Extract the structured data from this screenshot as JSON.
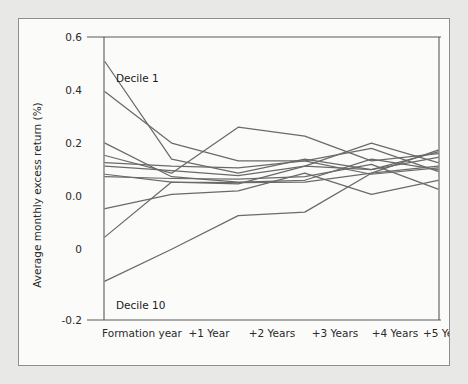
{
  "chart_data": {
    "type": "line",
    "title": "",
    "xlabel": "",
    "ylabel": "Average monthly excess return (%)",
    "categories": [
      "Formation year",
      "+1 Year",
      "+2 Years",
      "+3 Years",
      "+4 Years",
      "+5 Years"
    ],
    "x_tick_labels": [
      "Formation year",
      "+1 Year",
      "+2 Years",
      "+3 Years",
      "+4 Years",
      "+5 Years"
    ],
    "y_tick_labels": [
      "0.6",
      "0.4",
      "0.2",
      "0.0",
      "0",
      "-0.2"
    ],
    "y_tick_values": [
      0.6,
      0.4,
      0.2,
      0.0,
      -0.0,
      -0.2
    ],
    "ylim": [
      -0.2,
      0.6
    ],
    "grid": false,
    "legend": "none",
    "annotations": [
      {
        "text": "Decile 1",
        "series": "Decile 1",
        "position": "above-left-endpoint"
      },
      {
        "text": "Decile 10",
        "series": "Decile 10",
        "position": "below-left-endpoint"
      }
    ],
    "series": [
      {
        "name": "Decile 1",
        "values": [
          0.53,
          0.255,
          0.215,
          0.255,
          0.225,
          0.275
        ]
      },
      {
        "name": "Decile 2",
        "values": [
          0.445,
          0.3,
          0.25,
          0.25,
          0.212,
          0.23
        ]
      },
      {
        "name": "Decile 3",
        "values": [
          0.3,
          0.205,
          0.19,
          0.195,
          0.255,
          0.225
        ]
      },
      {
        "name": "Decile 4",
        "values": [
          0.265,
          0.215,
          0.345,
          0.32,
          0.25,
          0.27
        ]
      },
      {
        "name": "Decile 5",
        "values": [
          0.245,
          0.235,
          0.23,
          0.25,
          0.285,
          0.22
        ]
      },
      {
        "name": "Decile 6",
        "values": [
          0.235,
          0.222,
          0.208,
          0.235,
          0.3,
          0.245
        ]
      },
      {
        "name": "Decile 7",
        "values": [
          0.212,
          0.19,
          0.188,
          0.19,
          0.215,
          0.28
        ]
      },
      {
        "name": "Decile 8",
        "values": [
          0.205,
          0.2,
          0.198,
          0.205,
          0.24,
          0.17
        ]
      },
      {
        "name": "Decile 9",
        "values": [
          0.115,
          0.155,
          0.165,
          0.215,
          0.155,
          0.195
        ]
      },
      {
        "name": "Decile 9b",
        "values": [
          0.035,
          0.19,
          0.185,
          0.235,
          0.225,
          0.26
        ]
      },
      {
        "name": "Decile 10",
        "values": [
          -0.09,
          0.0,
          0.095,
          0.105,
          0.215,
          0.235
        ]
      }
    ]
  },
  "axis": {
    "y_title": "Average monthly excess return (%)"
  }
}
